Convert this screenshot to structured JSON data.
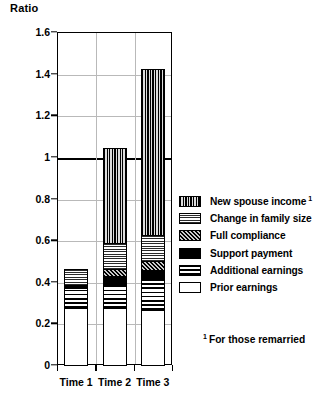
{
  "chart_data": {
    "type": "bar",
    "subtype": "stacked-bar",
    "title": "",
    "ylabel": "Ratio",
    "xlabel": "",
    "ylim": [
      0,
      1.6
    ],
    "ytick_values": [
      0,
      0.2,
      0.4,
      0.6,
      0.8,
      1,
      1.2,
      1.4,
      1.6
    ],
    "ytick_labels": [
      "0",
      "0.2",
      "0.4",
      "0.6",
      "0.8",
      "1",
      "1.2",
      "1.4",
      "1.6"
    ],
    "grid": true,
    "reference_line": 1,
    "legend_position": "right",
    "categories": [
      "Time 1",
      "Time 2",
      "Time 3"
    ],
    "series": [
      {
        "name": "Prior earnings",
        "pattern": "white",
        "values": [
          0.28,
          0.28,
          0.27
        ]
      },
      {
        "name": "Additional earnings",
        "pattern": "horizontal-lines",
        "values": [
          0.1,
          0.11,
          0.15
        ]
      },
      {
        "name": "Support payment",
        "pattern": "solid-black",
        "values": [
          0.02,
          0.05,
          0.05
        ]
      },
      {
        "name": "Full compliance",
        "pattern": "dark-speckle",
        "values": [
          0.0,
          0.04,
          0.05
        ]
      },
      {
        "name": "Change in family size",
        "pattern": "fine-crosshatch",
        "values": [
          0.08,
          0.13,
          0.13
        ]
      },
      {
        "name": "New spouse income",
        "pattern": "vertical-lines",
        "values": [
          0.0,
          0.46,
          0.8
        ]
      }
    ],
    "totals": [
      0.48,
      1.07,
      1.45
    ],
    "annotations": [
      "1 For those remarried"
    ]
  },
  "legend": {
    "items": [
      {
        "label": "New spouse income",
        "superscript": "1"
      },
      {
        "label": "Change in family size",
        "superscript": ""
      },
      {
        "label": "Full compliance",
        "superscript": ""
      },
      {
        "label": "Support payment",
        "superscript": ""
      },
      {
        "label": "Additional earnings",
        "superscript": ""
      },
      {
        "label": "Prior earnings",
        "superscript": ""
      }
    ]
  },
  "footnote": {
    "marker": "1",
    "text": "For those remarried"
  },
  "colors": {
    "axis": "#000000",
    "grid": "#b9b9b9",
    "reference_line": "#000000"
  }
}
